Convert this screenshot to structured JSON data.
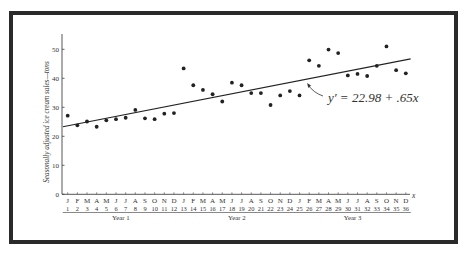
{
  "chart_data": {
    "type": "scatter",
    "title": "",
    "xlabel": "x",
    "ylabel": "Seasonally adjusted ice cream sales—tons",
    "ylim": [
      0,
      55
    ],
    "xlim": [
      1,
      36
    ],
    "grid": false,
    "yticks": [
      0,
      10,
      20,
      30,
      40,
      50
    ],
    "x": [
      1,
      2,
      3,
      4,
      5,
      6,
      7,
      8,
      9,
      10,
      11,
      12,
      13,
      14,
      15,
      16,
      17,
      18,
      19,
      20,
      21,
      22,
      23,
      24,
      25,
      26,
      27,
      28,
      29,
      30,
      31,
      32,
      33,
      34,
      35,
      36
    ],
    "month_labels": [
      "J",
      "F",
      "M",
      "A",
      "M",
      "J",
      "J",
      "A",
      "S",
      "O",
      "N",
      "D",
      "J",
      "F",
      "M",
      "A",
      "M",
      "J",
      "J",
      "A",
      "S",
      "O",
      "N",
      "D",
      "J",
      "F",
      "M",
      "A",
      "M",
      "J",
      "J",
      "A",
      "S",
      "O",
      "N",
      "D"
    ],
    "year_groups": [
      {
        "label": "Year 1",
        "from": 1,
        "to": 12
      },
      {
        "label": "Year 2",
        "from": 13,
        "to": 24
      },
      {
        "label": "Year 3",
        "from": 25,
        "to": 36
      }
    ],
    "series": [
      {
        "name": "Seasonally adjusted sales",
        "type": "scatter",
        "values": [
          27.1,
          23.8,
          25.1,
          23.3,
          25.5,
          25.9,
          26.4,
          29.1,
          26.2,
          25.9,
          27.8,
          28.0,
          43.4,
          37.6,
          36.0,
          34.5,
          32.0,
          38.5,
          37.6,
          34.9,
          34.9,
          30.8,
          34.1,
          35.6,
          34.1,
          46.2,
          44.3,
          49.9,
          48.7,
          41.0,
          41.5,
          40.8,
          44.3,
          51.0,
          42.8,
          41.7
        ]
      },
      {
        "name": "Trend line",
        "type": "line",
        "intercept": 22.98,
        "slope": 0.65,
        "x_range": [
          0.5,
          36.5
        ]
      }
    ],
    "annotations": [
      {
        "text": "y′ = 22.98 + .65x",
        "points_to": "trend line near x=25"
      }
    ]
  }
}
